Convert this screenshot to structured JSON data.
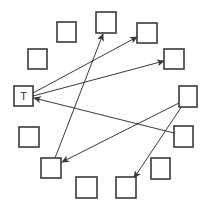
{
  "diagram": {
    "type": "directed-graph",
    "layout": "circle",
    "colors": {
      "stroke": "#3a3a3a",
      "fill": "#ffffff",
      "background": "#ffffff"
    },
    "nodes": [
      {
        "id": "T",
        "label": "T",
        "x": 14,
        "y": 86,
        "w": 19,
        "h": 20
      },
      {
        "id": "n1",
        "label": "",
        "x": 28,
        "y": 49,
        "w": 19,
        "h": 20
      },
      {
        "id": "n2",
        "label": "",
        "x": 57,
        "y": 22,
        "w": 19,
        "h": 20
      },
      {
        "id": "n3",
        "label": "",
        "x": 96,
        "y": 12,
        "w": 20,
        "h": 21
      },
      {
        "id": "n4",
        "label": "",
        "x": 137,
        "y": 23,
        "w": 20,
        "h": 20
      },
      {
        "id": "n5",
        "label": "",
        "x": 164,
        "y": 49,
        "w": 20,
        "h": 20
      },
      {
        "id": "n6",
        "label": "",
        "x": 179,
        "y": 86,
        "w": 18,
        "h": 21
      },
      {
        "id": "n7",
        "label": "",
        "x": 174,
        "y": 126,
        "w": 19,
        "h": 21
      },
      {
        "id": "n8",
        "label": "",
        "x": 151,
        "y": 158,
        "w": 19,
        "h": 21
      },
      {
        "id": "n9",
        "label": "",
        "x": 116,
        "y": 177,
        "w": 20,
        "h": 21
      },
      {
        "id": "n10",
        "label": "",
        "x": 76,
        "y": 177,
        "w": 21,
        "h": 21
      },
      {
        "id": "n11",
        "label": "",
        "x": 41,
        "y": 158,
        "w": 20,
        "h": 20
      },
      {
        "id": "n12",
        "label": "",
        "x": 19,
        "y": 127,
        "w": 20,
        "h": 20
      }
    ],
    "edges": [
      {
        "from": "T",
        "to": "n4",
        "x1": 33,
        "y1": 93,
        "x2": 137,
        "y2": 37
      },
      {
        "from": "T",
        "to": "n5",
        "x1": 33,
        "y1": 96,
        "x2": 164,
        "y2": 61
      },
      {
        "from": "n7",
        "to": "T",
        "x1": 174,
        "y1": 133,
        "x2": 34,
        "y2": 98
      },
      {
        "from": "n11",
        "to": "n3",
        "x1": 55,
        "y1": 158,
        "x2": 103,
        "y2": 34
      },
      {
        "from": "n6",
        "to": "n11",
        "x1": 179,
        "y1": 103,
        "x2": 62,
        "y2": 162
      },
      {
        "from": "n6",
        "to": "n9",
        "x1": 182,
        "y1": 106,
        "x2": 134,
        "y2": 178
      }
    ]
  }
}
